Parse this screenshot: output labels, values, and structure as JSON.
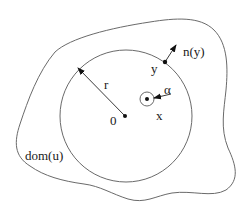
{
  "diagram": {
    "type": "geometric-domain-sketch",
    "colors": {
      "stroke": "#6a6a6a",
      "ink": "#111111",
      "background": "#ffffff"
    },
    "regions": {
      "outer_domain": {
        "label": "dom(u)",
        "shape": "irregular closed curve"
      },
      "ball": {
        "label_center": "0",
        "radius_label": "r",
        "center": [
          126,
          116
        ],
        "radius": 66
      },
      "small_ball": {
        "center": [
          147,
          99
        ],
        "radius": 7
      }
    },
    "points": {
      "origin": {
        "label": "0",
        "pos": [
          125,
          116
        ]
      },
      "x": {
        "label": "x",
        "pos": [
          147,
          99
        ]
      },
      "y": {
        "label": "y",
        "pos": [
          165,
          62
        ]
      }
    },
    "vectors": {
      "radius": {
        "label": "r",
        "from": [
          125,
          116
        ],
        "to": [
          78,
          68
        ]
      },
      "normal": {
        "label": "n(y)",
        "from": [
          165,
          62
        ],
        "to": [
          176,
          45
        ]
      },
      "alpha": {
        "label": "α",
        "from": [
          170,
          94
        ],
        "to": [
          154,
          98
        ]
      }
    },
    "labels": {
      "domain": "dom(u)",
      "radius": "r",
      "origin": "0",
      "point_x": "x",
      "point_y": "y",
      "normal": "n(y)",
      "alpha": "α"
    }
  }
}
